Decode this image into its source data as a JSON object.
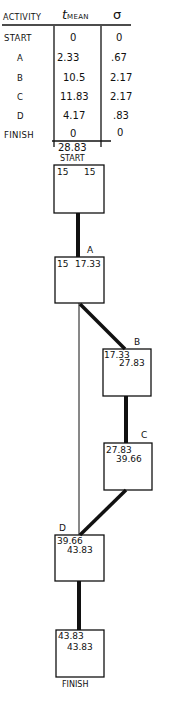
{
  "table": {
    "headers": {
      "activity": "ACTIVITY",
      "t_mean": "t",
      "t_mean_sub": "MEAN",
      "sigma": "σ"
    },
    "rows": [
      {
        "activity": "START",
        "t_mean": "0",
        "sigma": "0"
      },
      {
        "activity": "A",
        "t_mean": "2.33",
        "sigma": ".67"
      },
      {
        "activity": "B",
        "t_mean": "10.5",
        "sigma": "2.17"
      },
      {
        "activity": "C",
        "t_mean": "11.83",
        "sigma": "2.17"
      },
      {
        "activity": "D",
        "t_mean": "4.17",
        "sigma": ".83"
      },
      {
        "activity": "FINISH",
        "t_mean": "0",
        "sigma": "0"
      }
    ],
    "total": "28.83"
  },
  "network": {
    "nodes": [
      {
        "id": "start",
        "label": "START",
        "early": "15",
        "late": "15"
      },
      {
        "id": "a",
        "label": "A",
        "early": "15",
        "late": "17.33"
      },
      {
        "id": "b",
        "label": "B",
        "early": "17.33",
        "late": "27.83"
      },
      {
        "id": "c",
        "label": "C",
        "early": "27.83",
        "late": "39.66"
      },
      {
        "id": "d",
        "label": "D",
        "early": "39.66",
        "late": "43.83"
      },
      {
        "id": "finish",
        "label": "FINISH",
        "early": "43.83",
        "late": "43.83"
      }
    ],
    "edges": [
      {
        "from": "START",
        "to": "A",
        "critical": true
      },
      {
        "from": "A",
        "to": "B",
        "critical": true
      },
      {
        "from": "B",
        "to": "C",
        "critical": true
      },
      {
        "from": "C",
        "to": "D",
        "critical": true
      },
      {
        "from": "A",
        "to": "D",
        "critical": false
      },
      {
        "from": "D",
        "to": "FINISH",
        "critical": true
      }
    ]
  }
}
